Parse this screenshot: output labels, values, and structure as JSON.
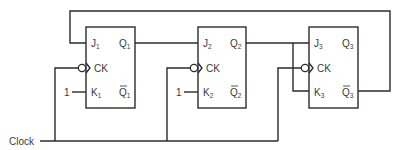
{
  "diagram": {
    "type": "circuit",
    "clock_label": "Clock",
    "flip_flops": [
      {
        "id": "FF1",
        "J": "J",
        "J_sub": "1",
        "K": "K",
        "K_sub": "1",
        "CK": "CK",
        "Q": "Q",
        "Q_sub": "1",
        "Qbar": "Q",
        "Qbar_sub": "1",
        "K_input_const": "1"
      },
      {
        "id": "FF2",
        "J": "J",
        "J_sub": "2",
        "K": "K",
        "K_sub": "2",
        "CK": "CK",
        "Q": "Q",
        "Q_sub": "2",
        "Qbar": "Q",
        "Qbar_sub": "2",
        "K_input_const": "1"
      },
      {
        "id": "FF3",
        "J": "J",
        "J_sub": "3",
        "K": "K",
        "K_sub": "3",
        "CK": "CK",
        "Q": "Q",
        "Q_sub": "3",
        "Qbar": "Q",
        "Qbar_sub": "3"
      }
    ],
    "connections": [
      "Q3bar -> J1 (feedback)",
      "Q1 -> J2",
      "Q2 -> J3 and K3",
      "1 -> K1",
      "1 -> K2",
      "Clock -> CK1, CK2, CK3 (inverted)"
    ],
    "colors": {
      "line": "#2b2b2b",
      "text": "#3a3a3a",
      "background": "#ffffff"
    }
  }
}
